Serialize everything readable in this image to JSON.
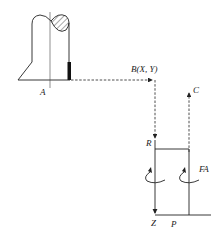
{
  "diagram": {
    "type": "mechanical coordinate schematic",
    "labels": {
      "A": "A",
      "B": "B(X, Y)",
      "C": "C",
      "R": "R",
      "FA": "FA",
      "Z": "Z",
      "P": "P"
    },
    "colors": {
      "line": "#222222",
      "background": "#ffffff"
    }
  }
}
